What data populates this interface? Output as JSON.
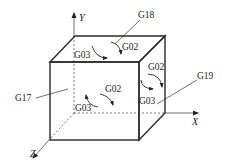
{
  "figure": {
    "axes": {
      "x_label": "X",
      "y_label": "Y",
      "z_label": "Z"
    },
    "plane_labels": {
      "g17": "G17",
      "g18": "G18",
      "g19": "G19"
    },
    "top_face": {
      "ccw_label": "G03",
      "cw_label": "G02"
    },
    "front_face": {
      "cw_label": "G02",
      "ccw_label": "G03"
    },
    "side_face": {
      "cw_label": "G02",
      "ccw_label": "G03"
    },
    "colors": {
      "line": "#2a2a2a",
      "text": "#222222",
      "background": "#ffffff"
    }
  }
}
